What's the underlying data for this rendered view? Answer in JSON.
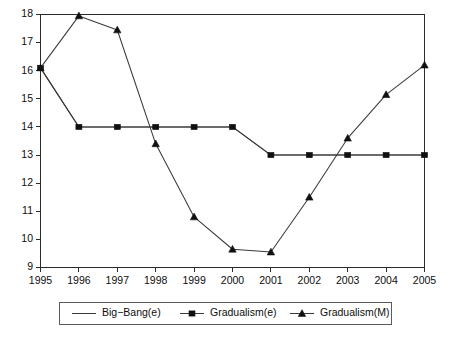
{
  "chart_data": {
    "type": "line",
    "title": "",
    "xlabel": "",
    "ylabel": "",
    "x": [
      1995,
      1996,
      1997,
      1998,
      1999,
      2000,
      2001,
      2002,
      2003,
      2004,
      2005
    ],
    "categories": [
      "1995",
      "1996",
      "1997",
      "1998",
      "1999",
      "2000",
      "2001",
      "2002",
      "2003",
      "2004",
      "2005"
    ],
    "xlim": [
      1995,
      2005
    ],
    "ylim": [
      9,
      18
    ],
    "yticks": [
      9,
      10,
      11,
      12,
      13,
      14,
      15,
      16,
      17,
      18
    ],
    "ytick_labels": [
      "9",
      "10",
      "11",
      "12",
      "13",
      "14",
      "15",
      "16",
      "17",
      "18"
    ],
    "grid": false,
    "legend_position": "bottom",
    "series": [
      {
        "name": "Big−Bang(e)",
        "marker": "none",
        "values": [
          16.1,
          14.0,
          14.0,
          14.0,
          14.0,
          14.0,
          13.0,
          13.0,
          13.0,
          13.0,
          13.0
        ]
      },
      {
        "name": "Gradualism(e)",
        "marker": "square",
        "values": [
          16.1,
          14.0,
          14.0,
          14.0,
          14.0,
          14.0,
          13.0,
          13.0,
          13.0,
          13.0,
          13.0
        ]
      },
      {
        "name": "Gradualism(M)",
        "marker": "triangle",
        "values": [
          16.1,
          17.95,
          17.45,
          13.4,
          10.8,
          9.65,
          9.55,
          11.5,
          13.6,
          15.15,
          16.2
        ]
      }
    ]
  },
  "legend": {
    "entries": [
      {
        "label": "Big−Bang(e)",
        "marker": "none"
      },
      {
        "label": "Gradualism(e)",
        "marker": "square"
      },
      {
        "label": "Gradualism(M)",
        "marker": "triangle"
      }
    ]
  },
  "caption": {
    "text": ""
  },
  "colors": {
    "line": "#3a3a3a",
    "marker": "#101010",
    "axis": "#2b2b2b",
    "text": "#0d0d0d",
    "background": "#ffffff"
  }
}
